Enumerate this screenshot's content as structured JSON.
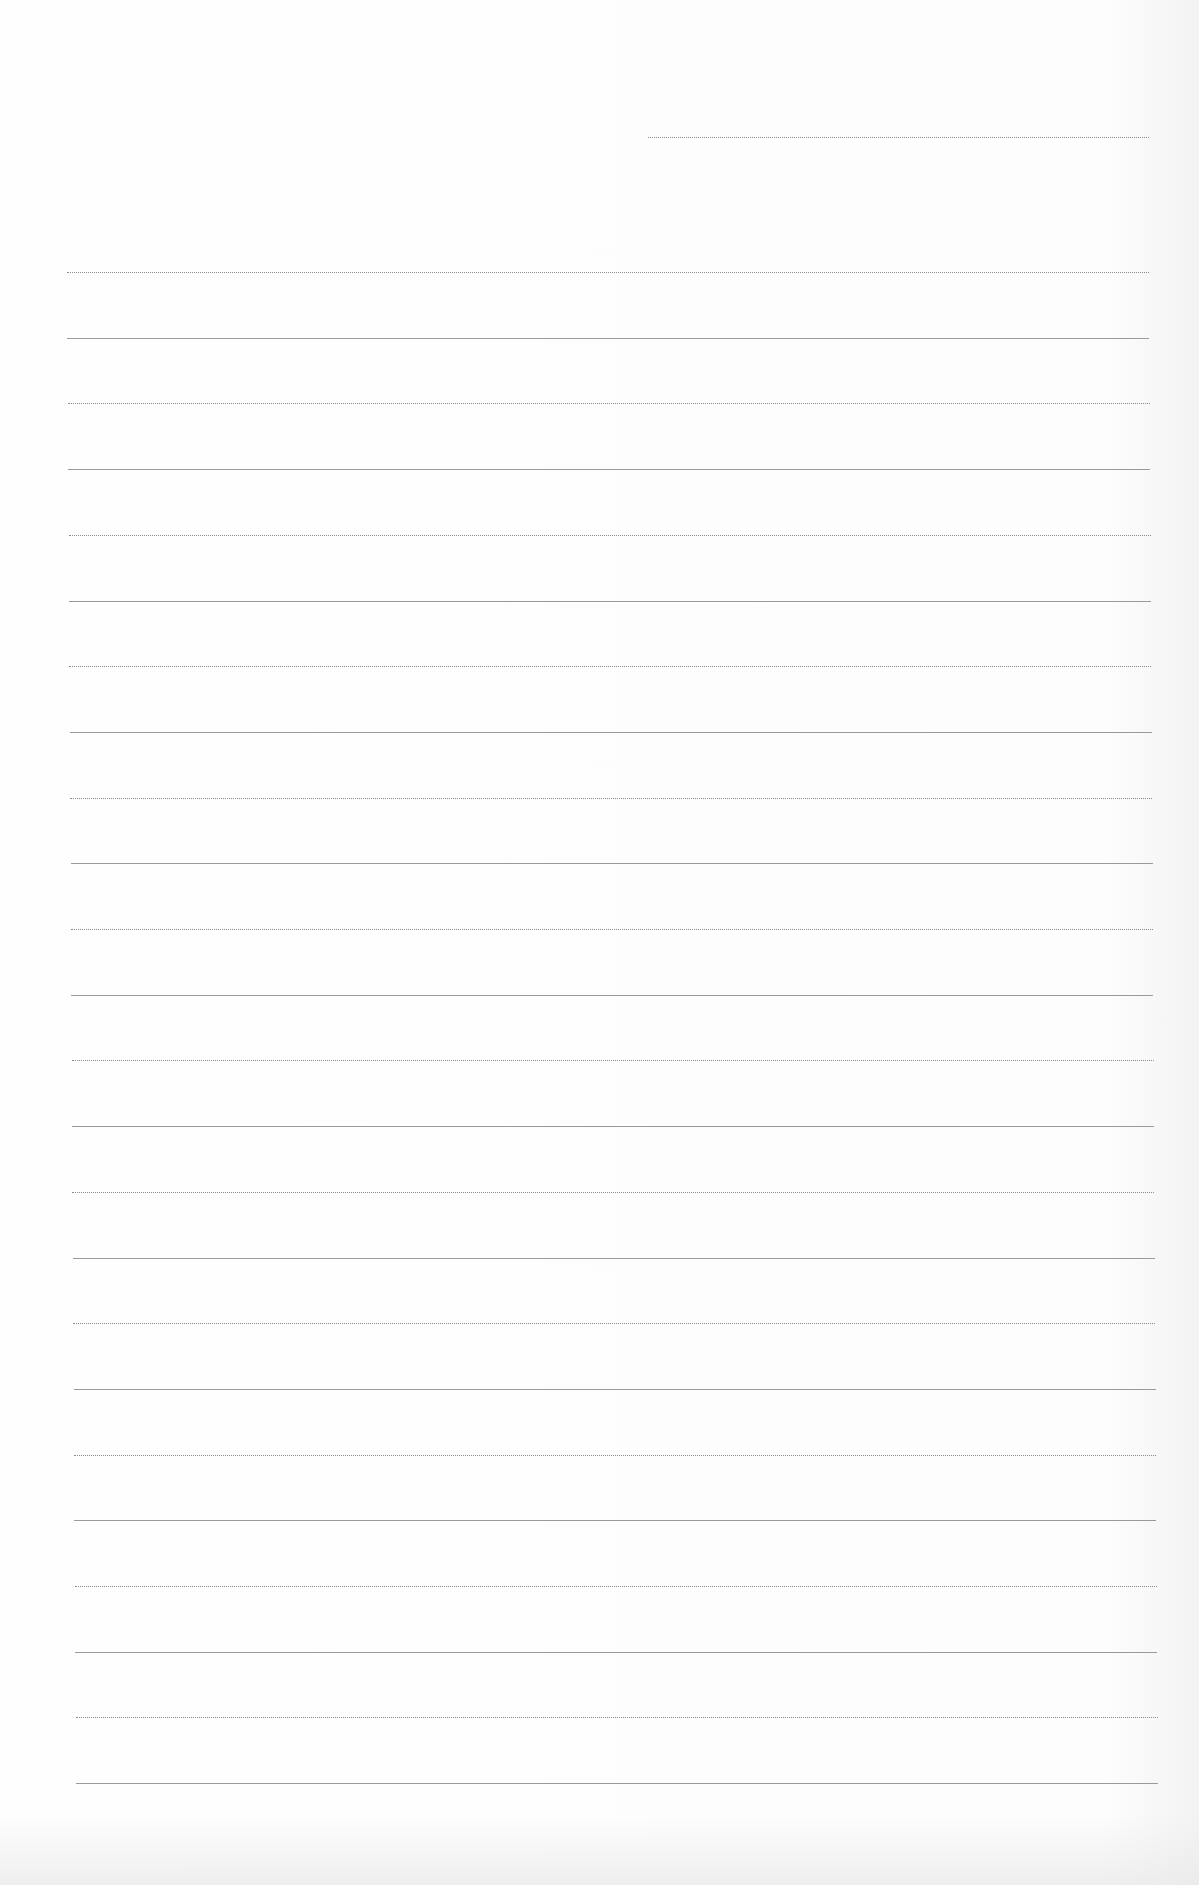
{
  "document": {
    "type": "lined-paper",
    "background_color": "#fdfdfd",
    "line_color": "#8a8a8a",
    "header_line": {
      "x_start": 648,
      "x_end": 1149,
      "y": 137
    },
    "ruled_lines": {
      "count": 24,
      "first_y": 272,
      "spacing": 65.7,
      "x_start_top": 67,
      "x_start_bottom": 76,
      "x_end_top": 1149,
      "x_end_bottom": 1158
    }
  }
}
